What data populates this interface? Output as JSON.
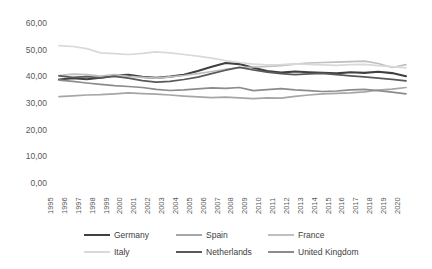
{
  "colors": {
    "background": "#ffffff",
    "tick_text": "#595959",
    "legend_text": "#404040"
  },
  "chart_data": {
    "type": "line",
    "title": "",
    "xlabel": "",
    "ylabel": "",
    "grid": false,
    "legend_position": "bottom",
    "ylim": [
      0,
      60
    ],
    "y_ticks": [
      {
        "label": "0,00",
        "value": 0
      },
      {
        "label": "10,00",
        "value": 10
      },
      {
        "label": "20,00",
        "value": 20
      },
      {
        "label": "30,00",
        "value": 30
      },
      {
        "label": "40,00",
        "value": 40
      },
      {
        "label": "50,00",
        "value": 50
      },
      {
        "label": "60,00",
        "value": 60
      }
    ],
    "categories": [
      "1995",
      "1996",
      "1997",
      "1998",
      "1999",
      "2000",
      "2001",
      "2002",
      "2003",
      "2004",
      "2005",
      "2006",
      "2007",
      "2008",
      "2009",
      "2010",
      "2011",
      "2012",
      "2013",
      "2014",
      "2015",
      "2016",
      "2017",
      "2018",
      "2019",
      "2020"
    ],
    "series": [
      {
        "name": "Germany",
        "color": "#404040",
        "values": [
          38.8,
          39.3,
          38.9,
          39.5,
          40.3,
          40.6,
          39.8,
          39.4,
          39.9,
          40.6,
          42.0,
          43.6,
          45.0,
          44.6,
          43.2,
          42.0,
          41.4,
          41.8,
          41.5,
          41.3,
          41.1,
          41.5,
          41.3,
          41.7,
          41.2,
          40.0
        ]
      },
      {
        "name": "Spain",
        "color": "#a6a6a6",
        "values": [
          32.4,
          32.7,
          33.0,
          33.1,
          33.4,
          33.8,
          33.5,
          33.3,
          33.0,
          32.6,
          32.3,
          32.0,
          32.2,
          31.9,
          31.6,
          31.9,
          31.8,
          32.5,
          33.0,
          33.4,
          33.6,
          33.8,
          34.2,
          34.8,
          35.2,
          35.8
        ]
      },
      {
        "name": "France",
        "color": "#bfbfbf",
        "values": [
          40.3,
          40.8,
          40.6,
          40.1,
          40.6,
          40.0,
          39.6,
          39.3,
          39.8,
          40.3,
          41.0,
          41.8,
          42.6,
          43.3,
          43.5,
          43.7,
          44.0,
          44.6,
          45.0,
          45.2,
          45.3,
          45.5,
          45.7,
          44.8,
          43.3,
          44.4
        ]
      },
      {
        "name": "Italy",
        "color": "#d9d9d9",
        "values": [
          51.5,
          51.2,
          50.4,
          48.8,
          48.5,
          48.2,
          48.6,
          49.2,
          48.8,
          48.2,
          47.6,
          46.8,
          45.9,
          45.2,
          44.6,
          44.3,
          44.4,
          44.7,
          44.5,
          44.3,
          44.1,
          44.4,
          44.5,
          44.0,
          43.6,
          43.2
        ]
      },
      {
        "name": "Netherlands",
        "color": "#595959",
        "values": [
          40.2,
          39.6,
          39.9,
          39.4,
          40.0,
          39.3,
          38.4,
          37.8,
          38.1,
          38.8,
          39.7,
          41.0,
          42.3,
          43.4,
          42.4,
          41.6,
          41.0,
          40.6,
          40.9,
          41.1,
          40.6,
          40.2,
          39.8,
          39.3,
          38.9,
          38.3
        ]
      },
      {
        "name": "United Kingdom",
        "color": "#8c8c8c",
        "values": [
          38.6,
          38.1,
          37.5,
          37.0,
          36.5,
          36.2,
          35.8,
          35.1,
          34.7,
          34.9,
          35.3,
          35.7,
          35.5,
          35.8,
          34.6,
          35.0,
          35.4,
          34.9,
          34.6,
          34.3,
          34.5,
          34.9,
          35.1,
          34.6,
          34.1,
          33.4
        ]
      }
    ],
    "legend_rows": [
      [
        "Germany",
        "Spain",
        "France"
      ],
      [
        "Italy",
        "Netherlands",
        "United Kingdom"
      ]
    ]
  }
}
